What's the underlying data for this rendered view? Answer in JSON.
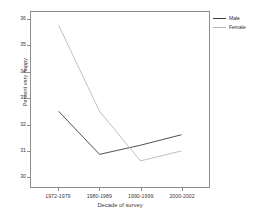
{
  "chart_data": {
    "type": "line",
    "title": "",
    "subtitle": "",
    "xlabel": "Decade of survey",
    "ylabel": "Percent very happy",
    "categories": [
      "1972-1979",
      "1980-1989",
      "1990-1999",
      "2000-2002"
    ],
    "ylim": [
      29.6,
      36.3
    ],
    "yticks": [
      30,
      31,
      32,
      33,
      34,
      35,
      36
    ],
    "ytick_labels": [
      "30",
      "31",
      "32",
      "33",
      "34",
      "35",
      "36"
    ],
    "grid": false,
    "legend_position": "right-top",
    "series": [
      {
        "name": "Male",
        "color": "#3c3c3c",
        "values": [
          32.5,
          30.85,
          31.2,
          31.6
        ]
      },
      {
        "name": "Female",
        "color": "#b9b9b9",
        "values": [
          35.8,
          32.5,
          30.6,
          30.98
        ]
      }
    ]
  },
  "legend": {
    "entries": [
      {
        "label": "Male",
        "color": "#3c3c3c"
      },
      {
        "label": "Female",
        "color": "#b9b9b9"
      }
    ]
  },
  "axes": {
    "frame_color": "#8d8d8d",
    "tick_color": "#8d8d8d",
    "label_color": "#3a3a3a"
  }
}
